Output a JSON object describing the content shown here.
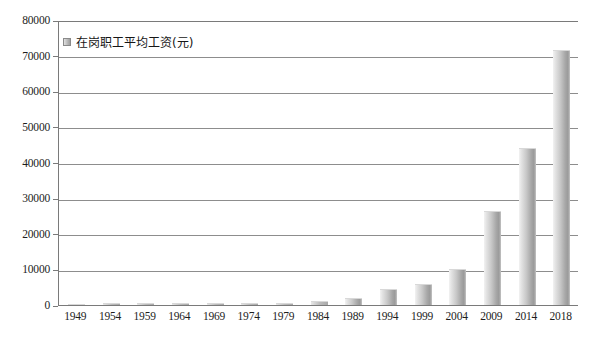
{
  "chart_data": {
    "type": "bar",
    "title": "",
    "subtitle": "",
    "xlabel": "",
    "ylabel": "",
    "legend": {
      "position": "top-left",
      "entries": [
        "在岗职工平均工资(元)"
      ]
    },
    "grid": true,
    "ylim": [
      0,
      80000
    ],
    "y_ticks": [
      0,
      10000,
      20000,
      30000,
      40000,
      50000,
      60000,
      70000,
      80000
    ],
    "y_tick_labels": [
      "0",
      "10000",
      "20000",
      "30000",
      "40000",
      "50000",
      "60000",
      "70000",
      "80000"
    ],
    "categories": [
      "1949",
      "1954",
      "1959",
      "1964",
      "1969",
      "1974",
      "1979",
      "1984",
      "1989",
      "1994",
      "1999",
      "2004",
      "2009",
      "2014",
      "2018"
    ],
    "series": [
      {
        "name": "在岗职工平均工资(元)",
        "values": [
          400,
          500,
          550,
          600,
          600,
          620,
          700,
          1100,
          1900,
          4500,
          6000,
          10000,
          26500,
          44000,
          71500
        ]
      }
    ],
    "colors": {
      "bar_light": "#e8e8e8",
      "bar_dark": "#9a9a9a",
      "gridline": "#8d8d8d",
      "axis": "#7a7a7a",
      "text": "#1d1d1d",
      "background": "#ffffff"
    }
  }
}
